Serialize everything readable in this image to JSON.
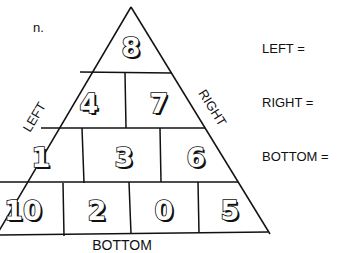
{
  "problem_label": "n.",
  "pyramid": {
    "rows": [
      [
        "8"
      ],
      [
        "4",
        "7"
      ],
      [
        "1",
        "3",
        "6"
      ],
      [
        "10",
        "2",
        "0",
        "5"
      ]
    ],
    "side_labels": {
      "left": "LEFT",
      "right": "RIGHT",
      "bottom": "BOTTOM"
    }
  },
  "questions": [
    {
      "label": "LEFT ="
    },
    {
      "label": "RIGHT ="
    },
    {
      "label": "BOTTOM ="
    }
  ]
}
